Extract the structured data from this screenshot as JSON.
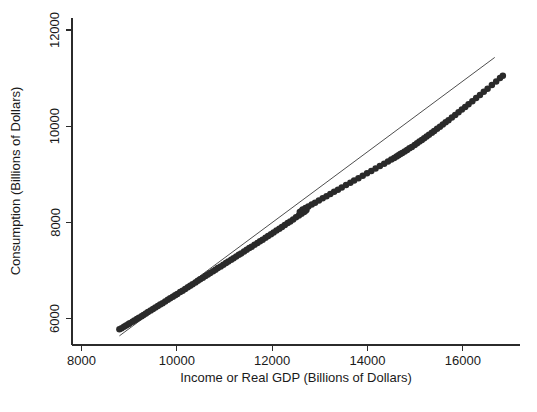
{
  "figure": {
    "background_color": "#ffffff",
    "foreground_color": "#2b2b2b",
    "marker_color": "#2a2a2a",
    "line_color": "#3a3a3a"
  },
  "chart_data": {
    "type": "scatter",
    "title": "",
    "xlabel": "Income or Real GDP (Billions of Dollars)",
    "ylabel": "Consumption (Billions of Dollars)",
    "xlim": [
      7800,
      17200
    ],
    "ylim": [
      5450,
      12250
    ],
    "xticks": [
      8000,
      10000,
      12000,
      14000,
      16000
    ],
    "xtick_labels": [
      "8000",
      "10000",
      "12000",
      "14000",
      "16000"
    ],
    "yticks": [
      6000,
      8000,
      10000,
      12000
    ],
    "ytick_labels": [
      "6000",
      "8000",
      "10000",
      "12000"
    ],
    "grid": false,
    "legend": "none",
    "marker": "filled-circle",
    "marker_size": 4.1,
    "series": [
      {
        "name": "Consumption vs Real GDP",
        "x": [
          8795,
          8840,
          8890,
          8935,
          8980,
          9010,
          9070,
          9110,
          9160,
          9205,
          9260,
          9300,
          9350,
          9395,
          9450,
          9500,
          9550,
          9600,
          9650,
          9700,
          9755,
          9810,
          9860,
          9915,
          9965,
          10010,
          10070,
          10120,
          10175,
          10230,
          10280,
          10330,
          10390,
          10440,
          10490,
          10545,
          10600,
          10650,
          10700,
          10760,
          10810,
          10860,
          10920,
          10975,
          11030,
          11080,
          11140,
          11190,
          11245,
          11300,
          11350,
          11410,
          11465,
          11520,
          11570,
          11630,
          11690,
          11745,
          11800,
          11860,
          11915,
          11975,
          12030,
          12090,
          12150,
          12205,
          12265,
          12325,
          12380,
          12440,
          12500,
          12560,
          12615,
          12670,
          12700,
          12720,
          12690,
          12650,
          12610,
          12580,
          12640,
          12700,
          12760,
          12830,
          12900,
          12980,
          13060,
          13140,
          13220,
          13300,
          13380,
          13460,
          13550,
          13640,
          13720,
          13810,
          13900,
          13990,
          14080,
          14170,
          14260,
          14350,
          14430,
          14500,
          14560,
          14610,
          14650,
          14690,
          14730,
          14780,
          14830,
          14880,
          14930,
          14990,
          15040,
          15090,
          15140,
          15190,
          15240,
          15290,
          15350,
          15400,
          15460,
          15520,
          15580,
          15640,
          15700,
          15770,
          15840,
          15910,
          15980,
          16050,
          16120,
          16200,
          16280,
          16360,
          16440,
          16520,
          16610,
          16700,
          16780,
          16840
        ],
        "y": [
          5780,
          5800,
          5830,
          5855,
          5880,
          5900,
          5935,
          5960,
          5990,
          6015,
          6050,
          6075,
          6105,
          6135,
          6170,
          6200,
          6230,
          6260,
          6290,
          6320,
          6355,
          6390,
          6420,
          6455,
          6485,
          6510,
          6550,
          6580,
          6615,
          6650,
          6680,
          6715,
          6750,
          6785,
          6815,
          6850,
          6885,
          6915,
          6945,
          6985,
          7015,
          7050,
          7085,
          7120,
          7155,
          7185,
          7225,
          7255,
          7290,
          7325,
          7355,
          7395,
          7430,
          7465,
          7495,
          7535,
          7570,
          7605,
          7640,
          7680,
          7715,
          7755,
          7790,
          7830,
          7870,
          7905,
          7945,
          7985,
          8020,
          8060,
          8105,
          8145,
          8180,
          8215,
          8240,
          8260,
          8250,
          8240,
          8230,
          8215,
          8270,
          8300,
          8330,
          8370,
          8410,
          8455,
          8500,
          8545,
          8590,
          8635,
          8680,
          8725,
          8775,
          8825,
          8870,
          8920,
          8970,
          9020,
          9070,
          9120,
          9170,
          9220,
          9265,
          9305,
          9340,
          9370,
          9395,
          9420,
          9445,
          9475,
          9505,
          9540,
          9570,
          9610,
          9645,
          9680,
          9715,
          9750,
          9785,
          9820,
          9865,
          9900,
          9945,
          9990,
          10035,
          10080,
          10125,
          10180,
          10235,
          10290,
          10345,
          10400,
          10455,
          10520,
          10585,
          10650,
          10715,
          10780,
          10855,
          10930,
          11000,
          11050
        ]
      }
    ],
    "fit_line": {
      "name": "linear-fit",
      "x_start": 8795,
      "y_start": 5640,
      "x_end": 16670,
      "y_end": 11430
    }
  }
}
